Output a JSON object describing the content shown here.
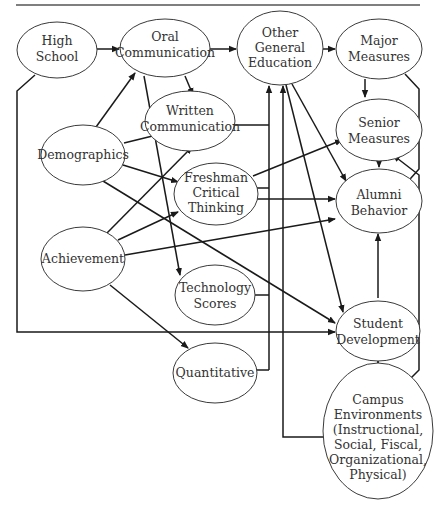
{
  "nodes": {
    "high_school": [
      "High",
      "School"
    ],
    "oral_communication": [
      "Oral",
      "Communication"
    ],
    "other_general_education": [
      "Other",
      "General",
      "Education"
    ],
    "major_measures": [
      "Major",
      "Measures"
    ],
    "written_communication": [
      "Written",
      "Communication"
    ],
    "demographics": [
      "Demographics"
    ],
    "freshman_critical_thinking": [
      "Freshman",
      "Critical",
      "Thinking"
    ],
    "senior_measures": [
      "Senior",
      "Measures"
    ],
    "alumni_behavior": [
      "Alumni",
      "Behavior"
    ],
    "achievement": [
      "Achievement"
    ],
    "technology_scores": [
      "Technology",
      "Scores"
    ],
    "student_development": [
      "Student",
      "Development"
    ],
    "quantitative": [
      "Quantitative"
    ],
    "campus_environments": [
      "Campus",
      "Environments",
      "(Instructional,",
      "Social, Fiscal,",
      "Organizational,",
      "Physical)"
    ]
  },
  "edges": [
    {
      "from": "High School",
      "to": "Oral Communication"
    },
    {
      "from": "High School",
      "to": "Student Development"
    },
    {
      "from": "Oral Communication",
      "to": "Other General Education"
    },
    {
      "from": "Oral Communication",
      "to": "Written Communication"
    },
    {
      "from": "Oral Communication",
      "to": "Technology Scores"
    },
    {
      "from": "Other General Education",
      "to": "Major Measures"
    },
    {
      "from": "Other General Education",
      "to": "Alumni Behavior"
    },
    {
      "from": "Other General Education",
      "to": "Student Development"
    },
    {
      "from": "Major Measures",
      "to": "Senior Measures"
    },
    {
      "from": "Major Measures",
      "to": "Alumni Behavior"
    },
    {
      "from": "Demographics",
      "to": "Oral Communication"
    },
    {
      "from": "Demographics",
      "to": "Written Communication"
    },
    {
      "from": "Demographics",
      "to": "Freshman Critical Thinking"
    },
    {
      "from": "Demographics",
      "to": "Student Development"
    },
    {
      "from": "Achievement",
      "to": "Written Communication"
    },
    {
      "from": "Achievement",
      "to": "Freshman Critical Thinking"
    },
    {
      "from": "Achievement",
      "to": "Alumni Behavior"
    },
    {
      "from": "Achievement",
      "to": "Quantitative"
    },
    {
      "from": "Written Communication",
      "to": "Other General Education"
    },
    {
      "from": "Freshman Critical Thinking",
      "to": "Other General Education"
    },
    {
      "from": "Freshman Critical Thinking",
      "to": "Senior Measures"
    },
    {
      "from": "Freshman Critical Thinking",
      "to": "Alumni Behavior"
    },
    {
      "from": "Technology Scores",
      "to": "Other General Education"
    },
    {
      "from": "Quantitative",
      "to": "Other General Education"
    },
    {
      "from": "Senior Measures",
      "to": "Alumni Behavior"
    },
    {
      "from": "Student Development",
      "to": "Alumni Behavior"
    },
    {
      "from": "Campus Environments",
      "to": "Student Development"
    },
    {
      "from": "Campus Environments",
      "to": "Senior Measures"
    },
    {
      "from": "Campus Environments",
      "to": "Other General Education"
    }
  ]
}
